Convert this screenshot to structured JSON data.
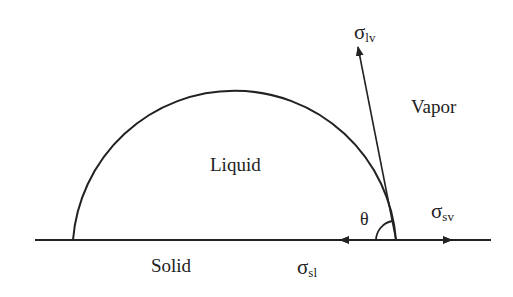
{
  "diagram": {
    "regions": {
      "liquid": "Liquid",
      "vapor": "Vapor",
      "solid": "Solid"
    },
    "forces": {
      "liquid_vapor": {
        "symbol": "σ",
        "subscript": "lv"
      },
      "solid_vapor": {
        "symbol": "σ",
        "subscript": "sv"
      },
      "solid_liquid": {
        "symbol": "σ",
        "subscript": "sl"
      }
    },
    "angle": "θ",
    "colors": {
      "line": "#222222",
      "background": "#ffffff"
    }
  }
}
